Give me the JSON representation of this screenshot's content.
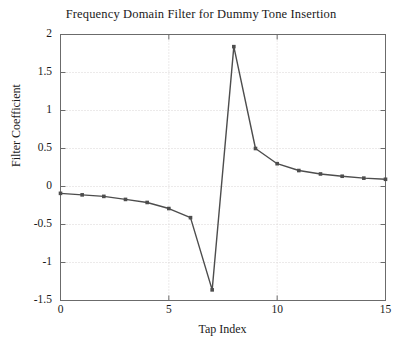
{
  "chart_data": {
    "type": "line",
    "title": "Frequency Domain Filter for Dummy Tone Insertion",
    "xlabel": "Tap Index",
    "ylabel": "Filter Coefficient",
    "x": [
      0,
      1,
      2,
      3,
      4,
      5,
      6,
      7,
      8,
      9,
      10,
      11,
      12,
      13,
      14,
      15
    ],
    "values": [
      -0.09,
      -0.11,
      -0.13,
      -0.17,
      -0.21,
      -0.29,
      -0.41,
      -1.36,
      1.84,
      0.5,
      0.3,
      0.21,
      0.165,
      0.135,
      0.11,
      0.095
    ],
    "series": [
      {
        "name": "Filter Coefficient",
        "values": [
          -0.09,
          -0.11,
          -0.13,
          -0.17,
          -0.21,
          -0.29,
          -0.41,
          -1.36,
          1.84,
          0.5,
          0.3,
          0.21,
          0.165,
          0.135,
          0.11,
          0.095
        ]
      }
    ],
    "xlim": [
      0,
      15
    ],
    "ylim": [
      -1.5,
      2
    ],
    "xticks": [
      0,
      5,
      10,
      15
    ],
    "xtick_labels": [
      "0",
      "5",
      "10",
      "15"
    ],
    "yticks": [
      -1.5,
      -1,
      -0.5,
      0,
      0.5,
      1,
      1.5,
      2
    ],
    "ytick_labels": [
      "-1.5",
      "-1",
      "-0.5",
      "0",
      "0.5",
      "1",
      "1.5",
      "2"
    ],
    "grid": true,
    "grid_style": "dotted",
    "legend": null,
    "line_color": "#4d4d4d",
    "marker": "square",
    "marker_color": "#4d4d4d",
    "axis_color": "#6b6b6b",
    "grid_color": "#d9d4d4",
    "background": "#ffffff"
  }
}
